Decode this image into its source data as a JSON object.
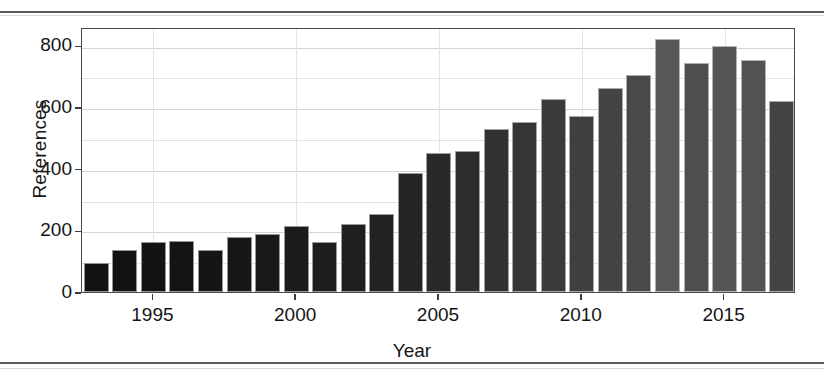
{
  "figure": {
    "background_color": "#ffffff",
    "panel_border_color": "#4a4a4a",
    "grid_color": "#e2e2e2",
    "scan_rule_color": "#5a5a5a"
  },
  "chart_data": {
    "type": "bar",
    "title": "",
    "xlabel": "Year",
    "ylabel": "References",
    "categories": [
      "1993",
      "1994",
      "1995",
      "1996",
      "1997",
      "1998",
      "1999",
      "2000",
      "2001",
      "2002",
      "2003",
      "2004",
      "2005",
      "2006",
      "2007",
      "2008",
      "2009",
      "2010",
      "2011",
      "2012",
      "2013",
      "2014",
      "2015",
      "2016",
      "2017"
    ],
    "values": [
      95,
      135,
      163,
      165,
      138,
      180,
      190,
      215,
      163,
      220,
      253,
      385,
      450,
      457,
      528,
      553,
      625,
      572,
      662,
      705,
      822,
      742,
      800,
      753,
      620
    ],
    "bar_colors": [
      "#111111",
      "#121212",
      "#131313",
      "#141414",
      "#151515",
      "#171717",
      "#191919",
      "#1b1b1b",
      "#1d1d1d",
      "#1f1f1f",
      "#222222",
      "#252525",
      "#292929",
      "#2d2d2d",
      "#313131",
      "#353535",
      "#3a3a3a",
      "#3f3f3f",
      "#444444",
      "#494949",
      "#585858",
      "#4e4e4e",
      "#565656",
      "#525252",
      "#444444"
    ],
    "xlim": [
      1992.5,
      2017.5
    ],
    "ylim": [
      0,
      860
    ],
    "xticks": [
      1995,
      2000,
      2005,
      2010,
      2015
    ],
    "xtick_labels": [
      "1995",
      "2000",
      "2005",
      "2010",
      "2015"
    ],
    "yticks": [
      0,
      200,
      400,
      600,
      800
    ],
    "ytick_labels": [
      "0",
      "200",
      "400",
      "600",
      "800"
    ],
    "y_gridlines": [
      0,
      100,
      200,
      300,
      400,
      500,
      600,
      700,
      800
    ],
    "x_gridlines": [
      1995,
      2000,
      2005,
      2010,
      2015
    ],
    "grid": true,
    "legend": "none"
  }
}
